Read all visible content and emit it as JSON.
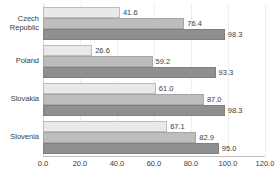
{
  "chart_data": {
    "type": "bar",
    "orientation": "horizontal",
    "title": "",
    "xlabel": "",
    "ylabel": "",
    "xlim": [
      0.0,
      120.0
    ],
    "xticks": [
      "0.0",
      "20.0",
      "40.0",
      "60.0",
      "80.0",
      "100.0",
      "120.0"
    ],
    "xtick_values": [
      0,
      20,
      40,
      60,
      80,
      100,
      120
    ],
    "grid": true,
    "grid_axis": "x",
    "legend": "none",
    "categories": [
      "Czech Republic",
      "Poland",
      "Slovakia",
      "Slovenia"
    ],
    "category_lines": [
      [
        "Czech",
        "Republic"
      ],
      [
        "Poland"
      ],
      [
        "Slovakia"
      ],
      [
        "Slovenia"
      ]
    ],
    "series": [
      {
        "name": "series-1",
        "color": "#e9e9e9",
        "values": [
          41.6,
          26.6,
          61.0,
          67.1
        ],
        "labels": [
          "41.6",
          "26.6",
          "61.0",
          "67.1"
        ]
      },
      {
        "name": "series-2",
        "color": "#bdbdbd",
        "values": [
          76.4,
          59.2,
          87.0,
          82.9
        ],
        "labels": [
          "76.4",
          "59.2",
          "87.0",
          "82.9"
        ]
      },
      {
        "name": "series-3",
        "color": "#8f8f8f",
        "values": [
          98.3,
          93.3,
          98.3,
          95.0
        ],
        "labels": [
          "98.3",
          "93.3",
          "98.3",
          "95.0"
        ]
      }
    ]
  },
  "colors": {
    "series_1": "#e9e9e9",
    "series_2": "#bdbdbd",
    "series_3": "#8f8f8f",
    "gridline": "#efefef",
    "axis": "#bfbfbf",
    "text": "#3c3c3c",
    "background": "#ffffff"
  }
}
